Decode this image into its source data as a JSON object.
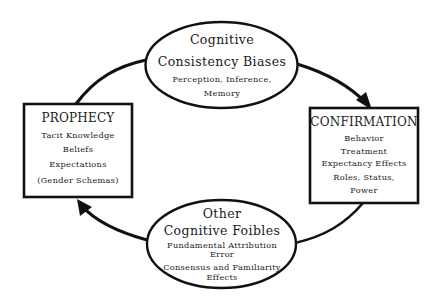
{
  "diagram": {
    "type": "cycle",
    "nodes": {
      "top": {
        "shape": "ellipse",
        "title_lines": [
          "Cognitive",
          "Consistency Biases"
        ],
        "sub_lines": [
          "Perception, Inference,",
          "Memory"
        ]
      },
      "right": {
        "shape": "box",
        "title": "CONFIRMATION",
        "items": [
          "Behavior",
          "Treatment",
          "Expectancy Effects",
          "Roles, Status,",
          "Power"
        ]
      },
      "bottom": {
        "shape": "ellipse",
        "title_lines": [
          "Other",
          "Cognitive Foibles"
        ],
        "sub_lines": [
          "Fundamental Attribution",
          "Error",
          "Consensus and Familiarity",
          "Effects"
        ]
      },
      "left": {
        "shape": "box",
        "title": "PROPHECY",
        "items": [
          "Tacit Knowledge",
          "Beliefs",
          "Expectations",
          "(Gender Schemas)"
        ]
      }
    },
    "edges": [
      {
        "from": "left",
        "to": "top",
        "arrowhead": false
      },
      {
        "from": "top",
        "to": "right",
        "arrowhead": true
      },
      {
        "from": "right",
        "to": "bottom",
        "arrowhead": false
      },
      {
        "from": "bottom",
        "to": "left",
        "arrowhead": true
      }
    ],
    "colors": {
      "stroke": "#111111",
      "text": "#1a1a1a",
      "background": "#ffffff"
    }
  }
}
